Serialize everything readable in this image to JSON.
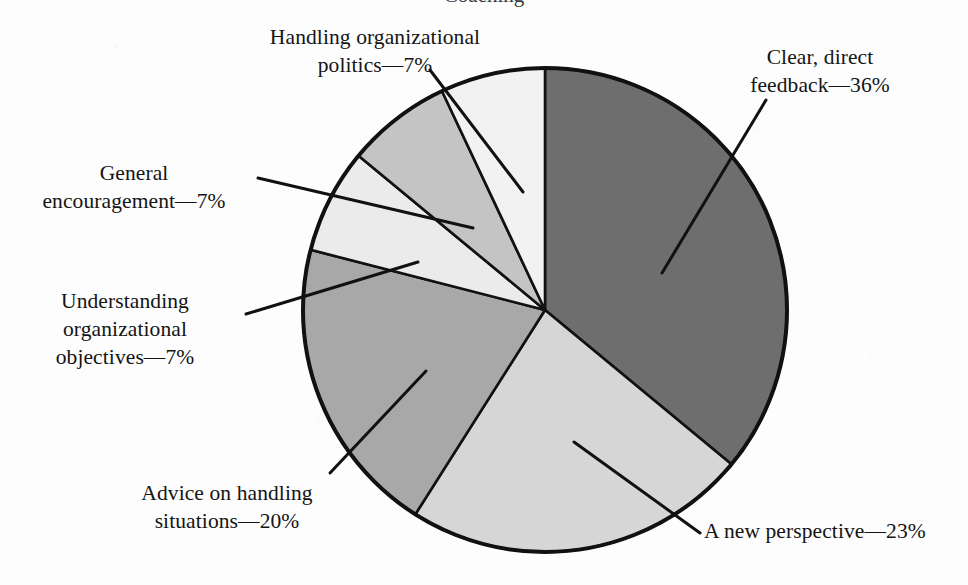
{
  "figure": {
    "background_color": "#fdfdfd",
    "cropped_title_fragment": "Coaching"
  },
  "chart_data": {
    "type": "pie",
    "title": "",
    "subtitle": "",
    "xlabel": "",
    "ylabel": "",
    "grid": false,
    "legend_position": "callout-labels",
    "units": "percent",
    "start_angle_deg": 0,
    "direction": "clockwise",
    "center": {
      "x": 545,
      "y": 310
    },
    "radius": 242,
    "categories": [
      "Clear, direct feedback",
      "A new perspective",
      "Advice on handling situations",
      "Understanding organizational objectives",
      "General encouragement",
      "Handling organizational politics"
    ],
    "values": [
      36,
      23,
      20,
      7,
      7,
      7
    ],
    "slices": [
      {
        "label": "Clear, direct feedback",
        "value": 36,
        "value_text": "36%",
        "label_text": "Clear, direct\nfeedback—36%",
        "color": "#6e6e6e",
        "start_angle_deg": 0,
        "end_angle_deg": 129.6,
        "leader_line": {
          "x1": 662,
          "y1": 273,
          "x2": 766,
          "y2": 100
        }
      },
      {
        "label": "A new perspective",
        "value": 23,
        "value_text": "23%",
        "label_text": "A new perspective—23%",
        "color": "#d6d6d6",
        "start_angle_deg": 129.6,
        "end_angle_deg": 212.4,
        "leader_line": {
          "x1": 574,
          "y1": 442,
          "x2": 700,
          "y2": 533
        }
      },
      {
        "label": "Advice on handling situations",
        "value": 20,
        "value_text": "20%",
        "label_text": "Advice on handling\nsituations—20%",
        "color": "#a8a8a8",
        "start_angle_deg": 212.4,
        "end_angle_deg": 284.4,
        "leader_line": {
          "x1": 426,
          "y1": 371,
          "x2": 330,
          "y2": 473
        }
      },
      {
        "label": "Understanding organizational objectives",
        "value": 7,
        "value_text": "7%",
        "label_text": "Understanding\norganizational\nobjectives—7%",
        "color": "#ebebeb",
        "start_angle_deg": 284.4,
        "end_angle_deg": 309.6,
        "leader_line": {
          "x1": 418,
          "y1": 262,
          "x2": 246,
          "y2": 314
        }
      },
      {
        "label": "General encouragement",
        "value": 7,
        "value_text": "7%",
        "label_text": "General\nencouragement—7%",
        "color": "#c4c4c4",
        "start_angle_deg": 309.6,
        "end_angle_deg": 334.8,
        "leader_line": {
          "x1": 473,
          "y1": 228,
          "x2": 258,
          "y2": 178
        }
      },
      {
        "label": "Handling organizational politics",
        "value": 7,
        "value_text": "7%",
        "label_text": "Handling organizational\npolitics—7%",
        "color": "#f2f2f2",
        "start_angle_deg": 334.8,
        "end_angle_deg": 360,
        "leader_line": {
          "x1": 523,
          "y1": 192,
          "x2": 430,
          "y2": 70
        }
      }
    ]
  },
  "labels": {
    "politics": "Handling organizational\npolitics—7%",
    "feedback": "Clear, direct\nfeedback—36%",
    "general": "General\nencouragement—7%",
    "understanding": "Understanding\norganizational\nobjectives—7%",
    "advice": "Advice on handling\nsituations—20%",
    "perspective": "A new perspective—23%"
  }
}
